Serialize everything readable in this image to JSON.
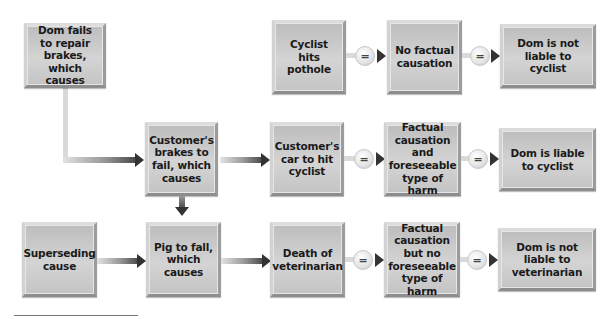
{
  "diagram": {
    "boxes": {
      "dom_fails": "Dom fails to repair brakes, which causes",
      "cyclist_hits_pothole": "Cyclist hits pothole",
      "no_factual_causation": "No factual causation",
      "dom_not_liable_cyclist": "Dom is not liable to cyclist",
      "customers_brakes_fail": "Customer's brakes to fail, which causes",
      "customers_car_hit": "Customer's car to hit cyclist",
      "factual_and_foreseeable": "Factual causation and foreseeable type of harm",
      "dom_liable_cyclist": "Dom is liable to cyclist",
      "superseding_cause": "Superseding cause",
      "pig_fall": "Pig to fall, which causes",
      "death_veterinarian": "Death of veterinarian",
      "factual_no_foreseeable": "Factual causation but no foreseeable type of harm",
      "dom_not_liable_vet": "Dom is not liable to veterinarian"
    },
    "equals_symbol": "=",
    "colors": {
      "box_fill": "#c9c9c9",
      "arrow_dark": "#333333",
      "background": "#ffffff"
    }
  }
}
